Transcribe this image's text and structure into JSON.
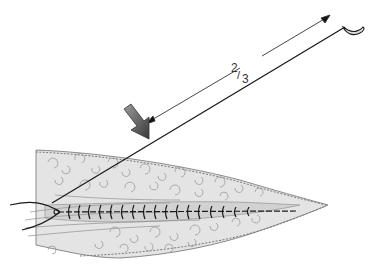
{
  "figure": {
    "fraction_label": {
      "numerator": "2",
      "slash": "/",
      "denominator": "3"
    },
    "colors": {
      "line": "#1a1a1a",
      "tissue_fill": "#e3e3e3",
      "tissue_edge": "#8a8a8a",
      "arrow_fill": "#6e6e6e",
      "arrow_dark": "#333333",
      "background": "#ffffff"
    },
    "elements": [
      "needle",
      "suture-thread",
      "measurement-arrow",
      "pointer-arrow",
      "tissue",
      "stitches"
    ]
  }
}
